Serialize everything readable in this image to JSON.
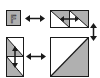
{
  "diagram": {
    "colors": {
      "fill": "#b0b0b0",
      "stroke": "#1a1a1a",
      "background": "#ffffff"
    },
    "tiles": [
      {
        "id": "letter-tile",
        "label": "F",
        "shape": "square",
        "fill": "gray"
      },
      {
        "id": "horizontal-pair",
        "shape": "two-cells-horizontal",
        "triangle": "top-right-gray"
      },
      {
        "id": "vertical-pair",
        "shape": "two-cells-vertical",
        "triangle": "bottom-left-gray"
      },
      {
        "id": "large-square",
        "shape": "square",
        "triangle": "bottom-right-gray"
      }
    ],
    "arrows": [
      {
        "id": "arrow-top",
        "direction": "horizontal-double",
        "between": [
          "letter-tile",
          "horizontal-pair"
        ]
      },
      {
        "id": "arrow-right",
        "direction": "vertical-double",
        "between": [
          "horizontal-pair",
          "large-square"
        ]
      },
      {
        "id": "arrow-bottom",
        "direction": "horizontal-double",
        "between": [
          "vertical-pair",
          "large-square"
        ]
      },
      {
        "id": "arrow-inner-h",
        "direction": "horizontal-double",
        "within": "horizontal-pair"
      },
      {
        "id": "arrow-inner-v",
        "direction": "vertical-double",
        "within": "vertical-pair"
      }
    ]
  }
}
